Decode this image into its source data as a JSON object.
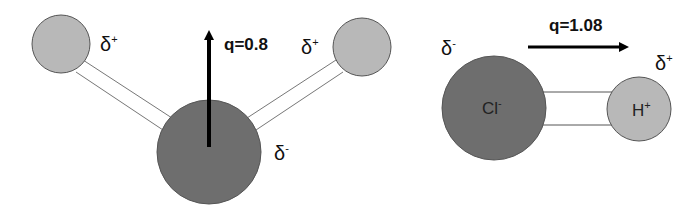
{
  "colors": {
    "heavy_atom": "#6e6e6e",
    "light_atom": "#b8b8b8",
    "outline": "#555555",
    "bond": "#777777",
    "arrow": "#000000",
    "text": "#111111"
  },
  "water": {
    "dipole_label": "q=0.8",
    "h_left": {
      "partial_charge": "δ",
      "sign": "+"
    },
    "h_right": {
      "partial_charge": "δ",
      "sign": "+"
    },
    "oxygen": {
      "partial_charge": "δ",
      "sign": "-"
    }
  },
  "hcl": {
    "dipole_label": "q=1.08",
    "chlorine": {
      "label": "Cl",
      "label_sign": "-",
      "partial_charge": "δ",
      "sign": "-"
    },
    "hydrogen": {
      "label": "H",
      "label_sign": "+",
      "partial_charge": "δ",
      "sign": "+"
    }
  }
}
